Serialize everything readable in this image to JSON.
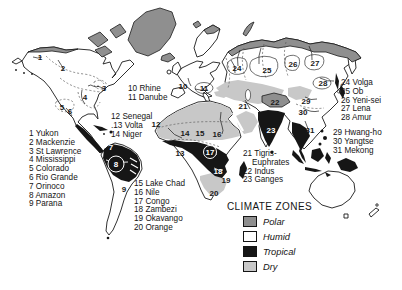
{
  "legend": {
    "title": "CLIMATE ZONES",
    "items": [
      {
        "label": "Polar",
        "color": "#8f8f8f"
      },
      {
        "label": "Humid",
        "color": "#ffffff"
      },
      {
        "label": "Tropical",
        "color": "#161616"
      },
      {
        "label": "Dry",
        "color": "#c8c8c8"
      }
    ]
  },
  "map_colors": {
    "polar": "#8f8f8f",
    "humid": "#ffffff",
    "tropical": "#161616",
    "dry": "#c8c8c8",
    "outline": "#1a1a1a"
  },
  "river_lists": {
    "north_america": [
      "1 Yukon",
      "2 Mackenzie",
      "3 St Lawrence",
      "4 Mississippi",
      "5 Colorado",
      "6 Rio Grande",
      "7 Orinoco",
      "8 Amazon",
      "9 Parana"
    ],
    "europe": [
      "10 Rhine",
      "11 Danube"
    ],
    "west_africa": [
      "12 Senegal",
      ".13 Volta",
      "14 Niger"
    ],
    "africa": [
      "15 Lake Chad",
      "16 Nile",
      "17 Congo",
      "18 Zambezi",
      "19 Okavango",
      "20 Orange"
    ],
    "south_asia": [
      "21 Tigris-",
      "    Euphrates",
      "22 Indus",
      "23 Ganges"
    ],
    "north_asia": [
      "24 Volga",
      "25 Ob",
      "26 Yeni-sei",
      "27 Lena",
      "28 Amur"
    ],
    "east_asia": [
      "29 Hwang-ho",
      "30 Yangtse",
      "31 Mekong"
    ]
  },
  "map_markers": [
    {
      "n": "1",
      "x": 40,
      "y": 57,
      "s": "p"
    },
    {
      "n": "2",
      "x": 63,
      "y": 68,
      "s": "p"
    },
    {
      "n": "3",
      "x": 104,
      "y": 88,
      "s": "p"
    },
    {
      "n": "4",
      "x": 85,
      "y": 97,
      "s": "p"
    },
    {
      "n": "5",
      "x": 62,
      "y": 107,
      "s": "p"
    },
    {
      "n": "6",
      "x": 70,
      "y": 111,
      "s": "p"
    },
    {
      "n": "7",
      "x": 111,
      "y": 147,
      "s": "w"
    },
    {
      "n": "8",
      "x": 116,
      "y": 164,
      "s": "c"
    },
    {
      "n": "9",
      "x": 124,
      "y": 189,
      "s": "p"
    },
    {
      "n": "10",
      "x": 183,
      "y": 86,
      "s": "p"
    },
    {
      "n": "11",
      "x": 204,
      "y": 88,
      "s": "p"
    },
    {
      "n": "12",
      "x": 156,
      "y": 124,
      "s": "p"
    },
    {
      "n": "13",
      "x": 180,
      "y": 153,
      "s": "p"
    },
    {
      "n": "14",
      "x": 185,
      "y": 133,
      "s": "p"
    },
    {
      "n": "15",
      "x": 200,
      "y": 133,
      "s": "p"
    },
    {
      "n": "16",
      "x": 217,
      "y": 134,
      "s": "p"
    },
    {
      "n": "17",
      "x": 210,
      "y": 152,
      "s": "c"
    },
    {
      "n": "18",
      "x": 218,
      "y": 171,
      "s": "w"
    },
    {
      "n": "19",
      "x": 226,
      "y": 180,
      "s": "p"
    },
    {
      "n": "20",
      "x": 214,
      "y": 193,
      "s": "p"
    },
    {
      "n": "21",
      "x": 243,
      "y": 106,
      "s": "p"
    },
    {
      "n": "22",
      "x": 275,
      "y": 102,
      "s": "p"
    },
    {
      "n": "23",
      "x": 271,
      "y": 130,
      "s": "w"
    },
    {
      "n": "24",
      "x": 237,
      "y": 68,
      "s": "p"
    },
    {
      "n": "25",
      "x": 267,
      "y": 70,
      "s": "p"
    },
    {
      "n": "26",
      "x": 293,
      "y": 64,
      "s": "p"
    },
    {
      "n": "27",
      "x": 315,
      "y": 63,
      "s": "p"
    },
    {
      "n": "28",
      "x": 323,
      "y": 83,
      "s": "p"
    },
    {
      "n": "29",
      "x": 306,
      "y": 101,
      "s": "p"
    },
    {
      "n": "30",
      "x": 303,
      "y": 112,
      "s": "p"
    },
    {
      "n": "31",
      "x": 310,
      "y": 130,
      "s": "p"
    }
  ]
}
